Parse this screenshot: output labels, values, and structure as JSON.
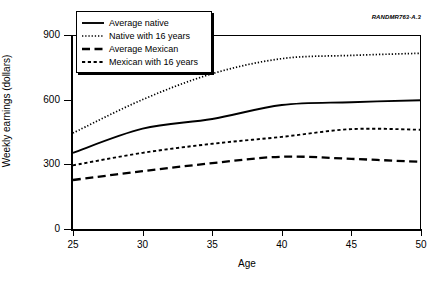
{
  "source_id": "RANDMR763-A.3",
  "axes": {
    "ylabel": "Weekly earnings (dollars)",
    "xlabel": "Age",
    "yticks": [
      "0",
      "300",
      "600",
      "900"
    ],
    "xticks": [
      "25",
      "30",
      "35",
      "40",
      "45",
      "50"
    ]
  },
  "legend": {
    "items": [
      {
        "label": "Average native",
        "style": "solid"
      },
      {
        "label": "Native with 16 years",
        "style": "dotted"
      },
      {
        "label": "Average Mexican",
        "style": "dashed-long"
      },
      {
        "label": "Mexican with 16 years",
        "style": "dashed-short"
      }
    ]
  },
  "chart_data": {
    "type": "line",
    "title": "",
    "xlabel": "Age",
    "ylabel": "Weekly earnings (dollars)",
    "xlim": [
      25,
      50
    ],
    "ylim": [
      0,
      900
    ],
    "xticks": [
      25,
      30,
      35,
      40,
      45,
      50
    ],
    "yticks": [
      0,
      300,
      600,
      900
    ],
    "grid": false,
    "legend_position": "top-left",
    "x": [
      25,
      30,
      35,
      40,
      45,
      50
    ],
    "series": [
      {
        "name": "Average native",
        "style": "solid",
        "values": [
          358,
          470,
          515,
          580,
          593,
          602
        ]
      },
      {
        "name": "Native with 16 years",
        "style": "dotted",
        "values": [
          450,
          605,
          725,
          795,
          810,
          820
        ]
      },
      {
        "name": "Average Mexican",
        "style": "dashed-long",
        "values": [
          232,
          273,
          310,
          340,
          330,
          316
        ]
      },
      {
        "name": "Mexican with 16 years",
        "style": "dashed-short",
        "values": [
          300,
          358,
          400,
          432,
          468,
          465
        ]
      }
    ]
  }
}
